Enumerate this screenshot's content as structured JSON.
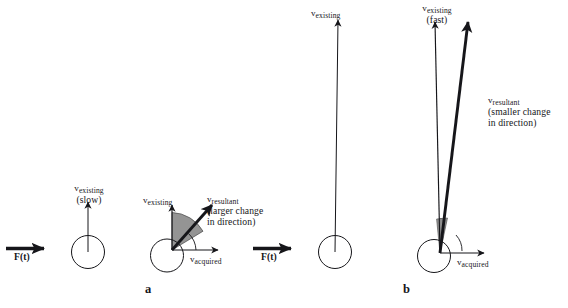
{
  "figure": {
    "background_color": "#ffffff",
    "ink_color": "#16161a",
    "wedge_fill_color": "#8c8c8c",
    "panels": [
      {
        "letter": "a",
        "description": "slow existing velocity, larger change in direction"
      },
      {
        "letter": "b",
        "description": "fast existing velocity, smaller change in direction"
      }
    ]
  },
  "labels": {
    "v_symbol": "v",
    "existing_sub": "existing",
    "resultant_sub": "resultant",
    "acquired_sub": "acquired",
    "slow_note": "(slow)",
    "fast_note": "(fast)",
    "larger_change_line1": "(larger change",
    "larger_change_line2": "in direction)",
    "smaller_change_line1": "(smaller change",
    "smaller_change_line2": "in direction)",
    "force": "F(t)"
  },
  "panel_a": {
    "letter": "a",
    "force_label": "F(t)",
    "left_figure": {
      "v_existing_symbol": "v",
      "v_existing_sub": "existing",
      "speed_note": "(slow)"
    },
    "right_figure": {
      "v_existing_symbol": "v",
      "v_existing_sub": "existing",
      "v_resultant_symbol": "v",
      "v_resultant_sub": "resultant",
      "v_acquired_symbol": "v",
      "v_acquired_sub": "acquired",
      "change_note_line1": "(larger change",
      "change_note_line2": "in direction)"
    }
  },
  "panel_b": {
    "letter": "b",
    "force_label": "F(t)",
    "left_figure": {
      "v_existing_symbol": "v",
      "v_existing_sub": "existing"
    },
    "right_figure": {
      "v_existing_symbol": "v",
      "v_existing_sub": "existing",
      "speed_note": "(fast)",
      "v_resultant_symbol": "v",
      "v_resultant_sub": "resultant",
      "v_acquired_symbol": "v",
      "v_acquired_sub": "acquired",
      "change_note_line1": "(smaller change",
      "change_note_line2": "in direction)"
    }
  }
}
